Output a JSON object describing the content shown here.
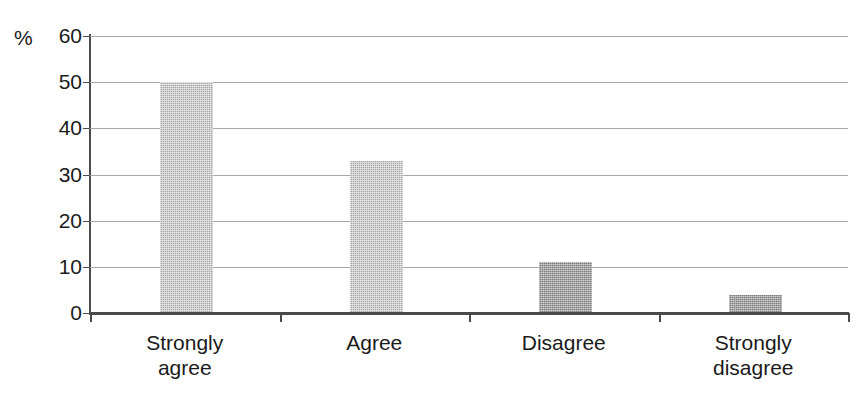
{
  "chart_data": {
    "type": "bar",
    "title": "",
    "subtitle": "",
    "xlabel": "",
    "ylabel": "%",
    "ylim": [
      0,
      60
    ],
    "ytick_labels": [
      "60",
      "50",
      "40",
      "30",
      "20",
      "10",
      "0"
    ],
    "ytick_values": [
      60,
      50,
      40,
      30,
      20,
      10,
      0
    ],
    "ytick_step": 10,
    "grid": true,
    "legend": null,
    "categories": [
      "Strongly\nagree",
      "Agree",
      "Disagree",
      "Strongly\ndisagree"
    ],
    "categories_plain": [
      "Strongly agree",
      "Agree",
      "Disagree",
      "Strongly disagree"
    ],
    "values": [
      50,
      33,
      11,
      4
    ],
    "bar_colors": [
      "#a5a5a5",
      "#a5a5a5",
      "#7b7b7b",
      "#7b7b7b"
    ],
    "series": [
      {
        "name": "",
        "values": [
          50,
          33,
          11,
          4
        ]
      }
    ],
    "annotations": []
  },
  "axes": {
    "unit_label": "%"
  }
}
